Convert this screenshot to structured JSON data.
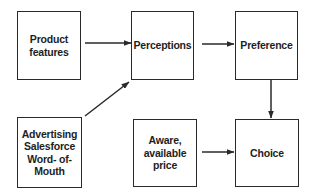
{
  "diagram": {
    "nodes": [
      {
        "id": "product-features",
        "label": "Product\nfeatures"
      },
      {
        "id": "perceptions",
        "label": "Perceptions"
      },
      {
        "id": "preference",
        "label": "Preference"
      },
      {
        "id": "advertising",
        "label": "Advertising\nSalesforce\nWord- of-\nMouth"
      },
      {
        "id": "aware-price",
        "label": "Aware,\navailable\nprice"
      },
      {
        "id": "choice",
        "label": "Choice"
      }
    ],
    "edges": [
      {
        "from": "product-features",
        "to": "perceptions"
      },
      {
        "from": "perceptions",
        "to": "preference"
      },
      {
        "from": "advertising",
        "to": "perceptions"
      },
      {
        "from": "preference",
        "to": "choice"
      },
      {
        "from": "aware-price",
        "to": "choice"
      }
    ]
  },
  "colors": {
    "stroke": "#2a2a2a",
    "text": "#1e1e1e",
    "background": "#ffffff"
  }
}
